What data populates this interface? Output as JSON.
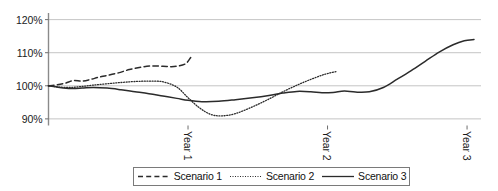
{
  "chart_data": {
    "type": "line",
    "title": "",
    "xlabel": "",
    "ylabel": "",
    "ylim": [
      88,
      122
    ],
    "yticks": [
      "90%",
      "100%",
      "110%",
      "120%"
    ],
    "ytick_values": [
      90,
      100,
      110,
      120
    ],
    "xticks": [
      "Year 1",
      "Year 2",
      "Year 3"
    ],
    "xtick_values": [
      1,
      2,
      3
    ],
    "xlim": [
      0,
      3.1
    ],
    "grid": "horizontal",
    "legend_position": "bottom-center",
    "series": [
      {
        "name": "Scenario 1",
        "style": "dashed",
        "color": "#2b2b2b",
        "x": [
          0.0,
          0.06,
          0.12,
          0.18,
          0.24,
          0.3,
          0.36,
          0.42,
          0.5,
          0.58,
          0.66,
          0.74,
          0.82,
          0.9,
          0.98,
          1.02
        ],
        "values": [
          100.0,
          100.3,
          100.8,
          101.6,
          101.4,
          101.9,
          102.6,
          103.1,
          103.9,
          104.9,
          105.6,
          106.0,
          105.9,
          105.8,
          106.6,
          108.6
        ]
      },
      {
        "name": "Scenario 2",
        "style": "dotted",
        "color": "#2b2b2b",
        "x": [
          0.0,
          0.08,
          0.16,
          0.24,
          0.32,
          0.42,
          0.52,
          0.62,
          0.72,
          0.82,
          0.92,
          1.0,
          1.08,
          1.16,
          1.24,
          1.34,
          1.46,
          1.58,
          1.7,
          1.82,
          1.94,
          2.0,
          2.06
        ],
        "values": [
          100.0,
          99.6,
          99.5,
          99.8,
          100.2,
          100.6,
          101.0,
          101.3,
          101.4,
          101.2,
          99.6,
          96.4,
          93.4,
          91.4,
          90.9,
          91.6,
          93.6,
          96.0,
          98.6,
          100.9,
          102.9,
          103.7,
          104.3
        ]
      },
      {
        "name": "Scenario 3",
        "style": "solid",
        "color": "#2b2b2b",
        "x": [
          0.0,
          0.08,
          0.16,
          0.24,
          0.32,
          0.42,
          0.52,
          0.62,
          0.72,
          0.82,
          0.92,
          1.0,
          1.1,
          1.22,
          1.34,
          1.46,
          1.58,
          1.68,
          1.78,
          1.88,
          1.96,
          2.04,
          2.12,
          2.2,
          2.3,
          2.4,
          2.5,
          2.6,
          2.7,
          2.8,
          2.9,
          2.98,
          3.05
        ],
        "values": [
          100.0,
          99.5,
          99.2,
          99.3,
          99.5,
          99.3,
          98.8,
          98.2,
          97.6,
          96.9,
          96.2,
          95.6,
          95.2,
          95.3,
          95.8,
          96.4,
          97.1,
          97.8,
          98.3,
          98.2,
          97.9,
          98.0,
          98.4,
          98.1,
          98.2,
          99.5,
          102.0,
          104.6,
          107.4,
          110.2,
          112.4,
          113.6,
          114.0
        ]
      }
    ]
  },
  "legend": {
    "items": [
      {
        "label": "Scenario 1",
        "style": "dashed"
      },
      {
        "label": "Scenario 2",
        "style": "dotted"
      },
      {
        "label": "Scenario 3",
        "style": "solid"
      }
    ]
  },
  "axes": {
    "y_axis_color": "#8a8a8a",
    "grid_color": "#bdbdbd",
    "tick_color": "#6e6e6e"
  }
}
